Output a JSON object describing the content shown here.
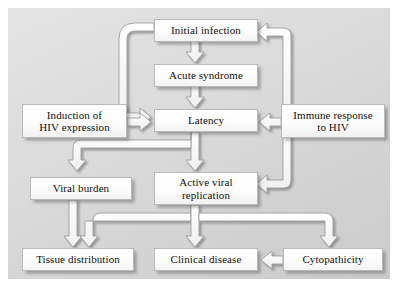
{
  "diagram": {
    "background_color": "#d9d9d9",
    "page_color": "#ffffff",
    "node_fill": "#ffffff",
    "arrow_fill": "#ffffff",
    "arrow_stroke": "#9a9a9a",
    "text_color": "#0f0f0f",
    "nodes": [
      {
        "id": "initial-infection",
        "label": "Initial infection",
        "x": 146,
        "y": 11,
        "w": 104,
        "h": 23
      },
      {
        "id": "acute-syndrome",
        "label": "Acute syndrome",
        "x": 146,
        "y": 56,
        "w": 104,
        "h": 23
      },
      {
        "id": "latency",
        "label": "Latency",
        "x": 146,
        "y": 101,
        "w": 104,
        "h": 23
      },
      {
        "id": "induction",
        "label": "Induction of\nHIV expression",
        "x": 14,
        "y": 96,
        "w": 105,
        "h": 34
      },
      {
        "id": "immune-response",
        "label": "Immune response\nto HIV",
        "x": 273,
        "y": 96,
        "w": 104,
        "h": 34
      },
      {
        "id": "viral-burden",
        "label": "Viral burden",
        "x": 22,
        "y": 169,
        "w": 102,
        "h": 23
      },
      {
        "id": "active-replication",
        "label": "Active viral\nreplication",
        "x": 146,
        "y": 164,
        "w": 104,
        "h": 33
      },
      {
        "id": "tissue-distribution",
        "label": "Tissue distribution",
        "x": 14,
        "y": 240,
        "w": 112,
        "h": 23
      },
      {
        "id": "clinical-disease",
        "label": "Clinical disease",
        "x": 146,
        "y": 240,
        "w": 104,
        "h": 23
      },
      {
        "id": "cytopathicity",
        "label": "Cytopathicity",
        "x": 275,
        "y": 240,
        "w": 100,
        "h": 23
      }
    ],
    "edges": [
      {
        "id": "initial-to-acute",
        "from": "initial-infection",
        "to": "acute-syndrome",
        "kind": "straight-down"
      },
      {
        "id": "acute-to-latency",
        "from": "acute-syndrome",
        "to": "latency",
        "kind": "straight-down"
      },
      {
        "id": "initial-to-latency",
        "from": "initial-infection",
        "to": "latency",
        "kind": "left-loop"
      },
      {
        "id": "induction-to-latency",
        "from": "induction",
        "to": "latency",
        "kind": "right-arrow"
      },
      {
        "id": "immune-to-initial",
        "from": "immune-response",
        "to": "initial-infection",
        "kind": "right-trunk-up"
      },
      {
        "id": "immune-to-latency",
        "from": "immune-response",
        "to": "latency",
        "kind": "left-arrow"
      },
      {
        "id": "immune-to-replication",
        "from": "immune-response",
        "to": "active-replication",
        "kind": "right-trunk-down"
      },
      {
        "id": "latency-to-replication",
        "from": "latency",
        "to": "active-replication",
        "kind": "straight-down"
      },
      {
        "id": "latency-to-viral-burden",
        "from": "latency",
        "to": "viral-burden",
        "kind": "left-branch"
      },
      {
        "id": "viral-burden-to-tissue",
        "from": "viral-burden",
        "to": "tissue-distribution",
        "kind": "straight-down"
      },
      {
        "id": "replication-to-tissue",
        "from": "active-replication",
        "to": "tissue-distribution",
        "kind": "bus-left"
      },
      {
        "id": "replication-to-clinical",
        "from": "active-replication",
        "to": "clinical-disease",
        "kind": "straight-down"
      },
      {
        "id": "replication-to-cyto",
        "from": "active-replication",
        "to": "cytopathicity",
        "kind": "bus-right"
      },
      {
        "id": "cyto-to-clinical",
        "from": "cytopathicity",
        "to": "clinical-disease",
        "kind": "left-arrow"
      }
    ]
  }
}
